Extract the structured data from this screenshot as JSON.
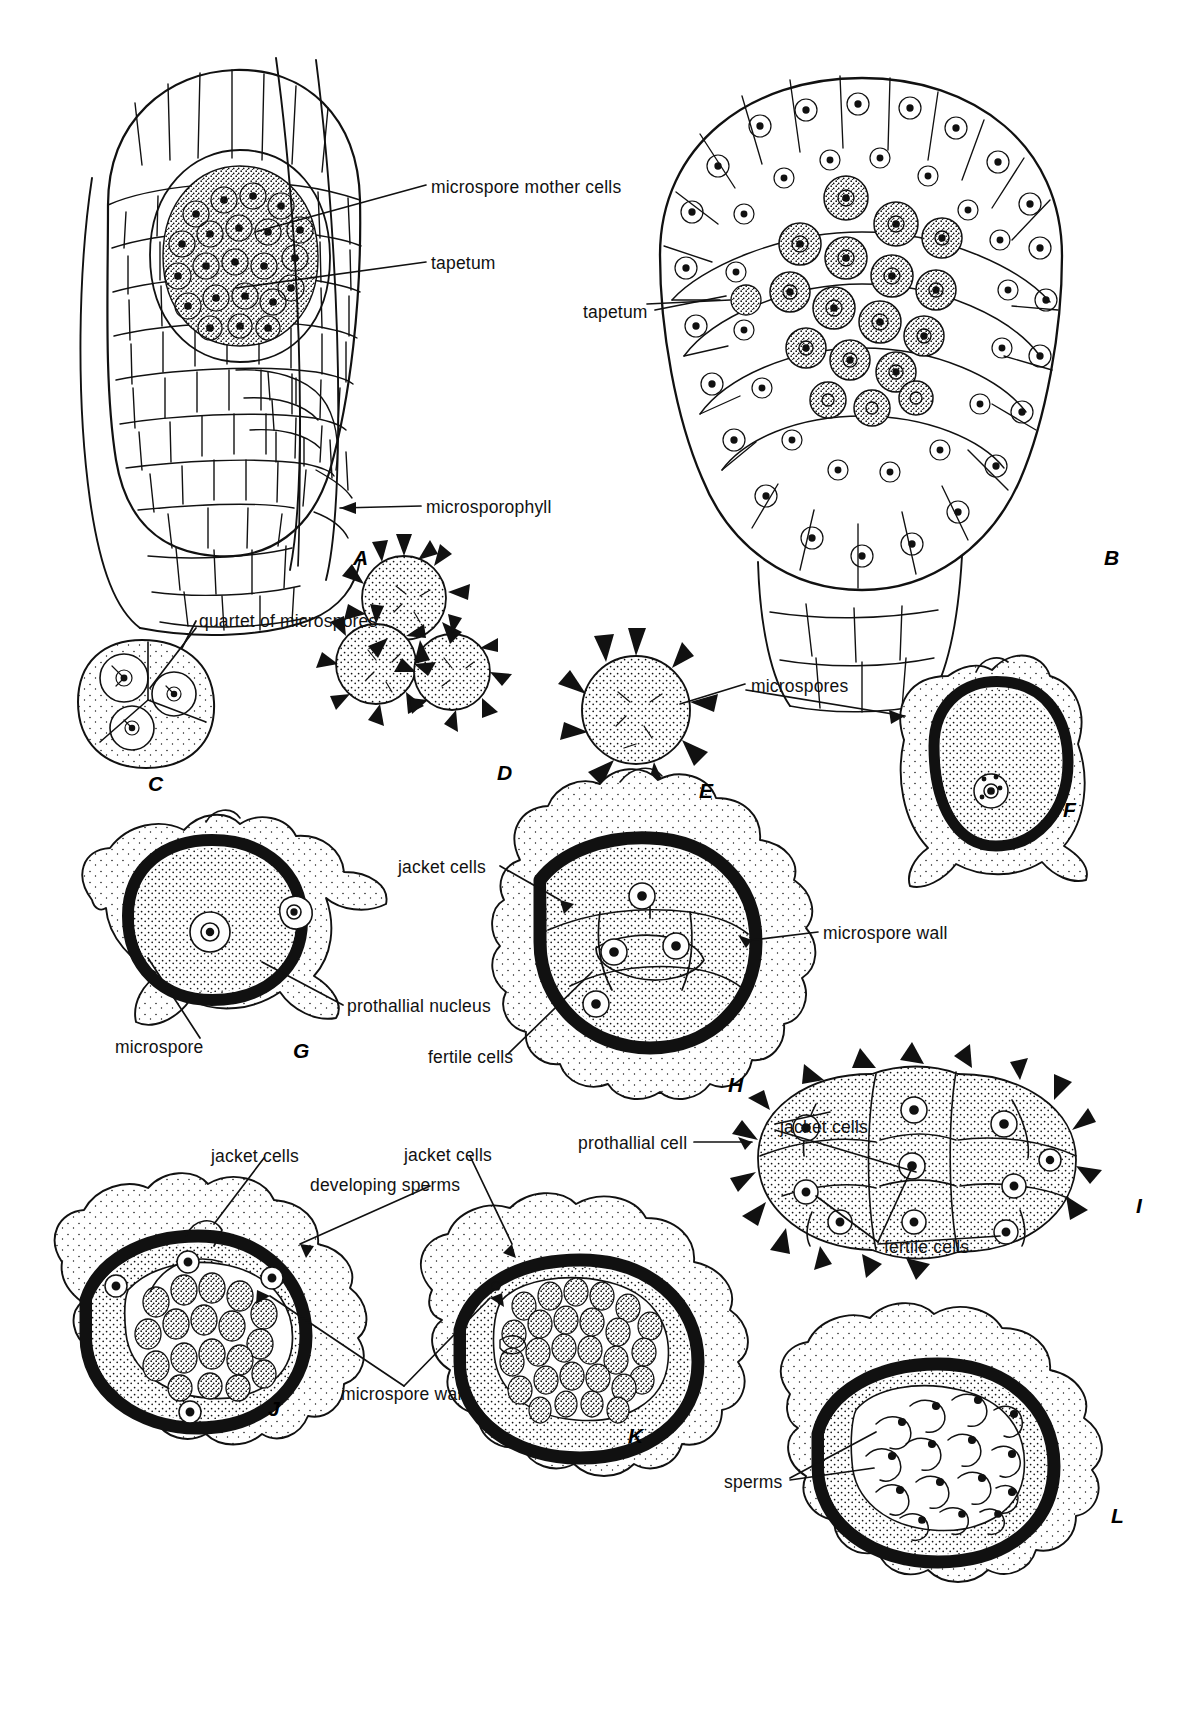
{
  "figure": {
    "kind": "botanical-illustration",
    "background_color": "#ffffff",
    "ink_color": "#111111"
  },
  "panels": [
    {
      "id": "A",
      "letter": "A",
      "x": 353,
      "y": 546
    },
    {
      "id": "B",
      "letter": "B",
      "x": 1104,
      "y": 546
    },
    {
      "id": "C",
      "letter": "C",
      "x": 148,
      "y": 772
    },
    {
      "id": "D",
      "letter": "D",
      "x": 497,
      "y": 761
    },
    {
      "id": "E",
      "letter": "E",
      "x": 699,
      "y": 779
    },
    {
      "id": "F",
      "letter": "F",
      "x": 1063,
      "y": 798
    },
    {
      "id": "G",
      "letter": "G",
      "x": 293,
      "y": 1039
    },
    {
      "id": "H",
      "letter": "H",
      "x": 728,
      "y": 1073
    },
    {
      "id": "I",
      "letter": "I",
      "x": 1136,
      "y": 1194
    },
    {
      "id": "J",
      "letter": "J",
      "x": 268,
      "y": 1397
    },
    {
      "id": "K",
      "letter": "K",
      "x": 628,
      "y": 1424
    },
    {
      "id": "L",
      "letter": "L",
      "x": 1111,
      "y": 1504
    }
  ],
  "labels": [
    {
      "id": "microspore-mother-cells",
      "text": "microspore mother cells",
      "x": 431,
      "y": 186,
      "anchor": "start"
    },
    {
      "id": "tapetum-a",
      "text": "tapetum",
      "x": 431,
      "y": 262,
      "anchor": "start"
    },
    {
      "id": "tapetum-b",
      "text": "tapetum",
      "x": 583,
      "y": 311,
      "anchor": "start"
    },
    {
      "id": "microsporophyll",
      "text": "microsporophyll",
      "x": 426,
      "y": 506,
      "anchor": "start"
    },
    {
      "id": "quartet-of-microspores",
      "text": "quartet of microspores",
      "x": 199,
      "y": 620,
      "anchor": "start"
    },
    {
      "id": "microspores",
      "text": "microspores",
      "x": 751,
      "y": 685,
      "anchor": "start"
    },
    {
      "id": "jacket-cells-h",
      "text": "jacket cells",
      "x": 398,
      "y": 866,
      "anchor": "start"
    },
    {
      "id": "microspore-wall-h",
      "text": "microspore wall",
      "x": 823,
      "y": 932,
      "anchor": "start"
    },
    {
      "id": "prothallial-nucleus",
      "text": "prothallial nucleus",
      "x": 347,
      "y": 1005,
      "anchor": "start"
    },
    {
      "id": "microspore-g",
      "text": "microspore",
      "x": 115,
      "y": 1046,
      "anchor": "start"
    },
    {
      "id": "fertile-cells-h",
      "text": "fertile cells",
      "x": 428,
      "y": 1056,
      "anchor": "start"
    },
    {
      "id": "jacket-cells-i",
      "text": "jacket cells",
      "x": 780,
      "y": 1126,
      "anchor": "start"
    },
    {
      "id": "prothallial-cell",
      "text": "prothallial cell",
      "x": 578,
      "y": 1142,
      "anchor": "start"
    },
    {
      "id": "jacket-cells-j",
      "text": "jacket cells",
      "x": 211,
      "y": 1155,
      "anchor": "start"
    },
    {
      "id": "jacket-cells-k",
      "text": "jacket cells",
      "x": 404,
      "y": 1154,
      "anchor": "start"
    },
    {
      "id": "developing-sperms",
      "text": "developing sperms",
      "x": 310,
      "y": 1184,
      "anchor": "start"
    },
    {
      "id": "fertile-cells-i",
      "text": "fertile cells",
      "x": 884,
      "y": 1246,
      "anchor": "start"
    },
    {
      "id": "microspore-wall-jk",
      "text": "microspore wall",
      "x": 341,
      "y": 1393,
      "anchor": "start"
    },
    {
      "id": "sperms",
      "text": "sperms",
      "x": 724,
      "y": 1481,
      "anchor": "start"
    }
  ]
}
